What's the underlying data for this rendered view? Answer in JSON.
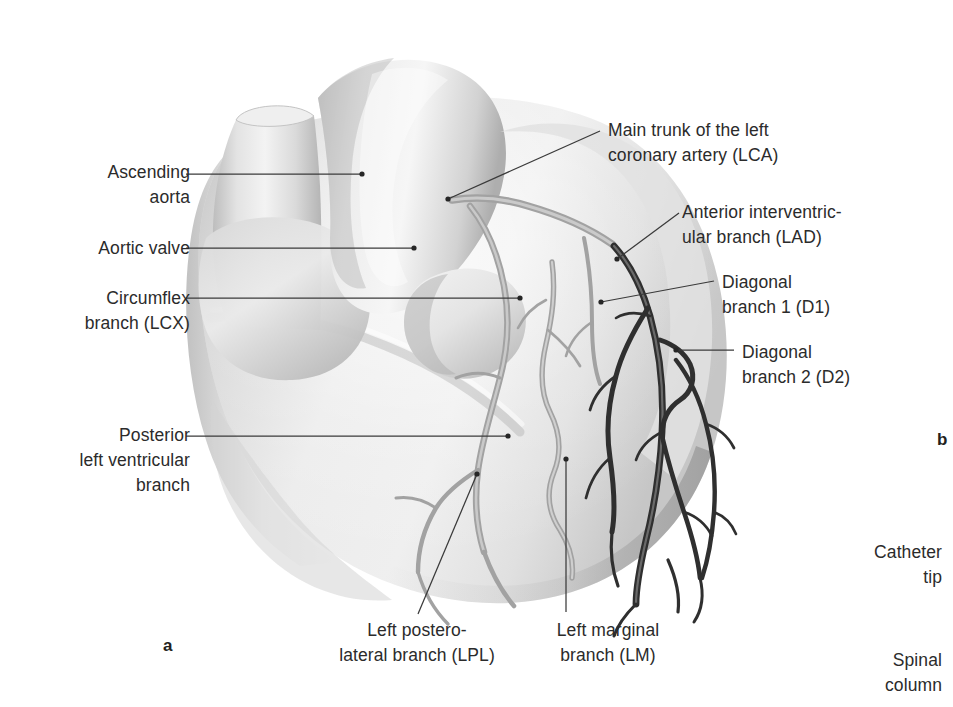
{
  "figure": {
    "domain_kind": "anatomical-illustration",
    "panels": [
      {
        "id": "a",
        "letter": "a"
      },
      {
        "id": "b",
        "letter": "b"
      }
    ],
    "palette": {
      "background": "#ffffff",
      "text": "#2b2b2b",
      "leader_line": "#3a3a3a",
      "myocardium_light": "#f2f2f2",
      "myocardium_mid": "#d9d9d9",
      "myocardium_shadow": "#9a9a9a",
      "vessel_light": "#a8a8a8",
      "vessel_dark": "#2e2e2e"
    }
  },
  "labels": {
    "left": [
      {
        "name": "ascending-aorta",
        "text": "Ascending\naorta"
      },
      {
        "name": "aortic-valve",
        "text": "Aortic valve"
      },
      {
        "name": "circumflex-branch",
        "text": "Circumflex\nbranch (LCX)"
      },
      {
        "name": "posterior-lv-branch",
        "text": "Posterior\nleft ventricular\nbranch"
      }
    ],
    "right": [
      {
        "name": "main-trunk-lca",
        "text": "Main trunk of the left\ncoronary artery (LCA)"
      },
      {
        "name": "lad-branch",
        "text": "Anterior interventric-\nular branch (LAD)"
      },
      {
        "name": "diagonal-1",
        "text": "Diagonal\nbranch 1 (D1)"
      },
      {
        "name": "diagonal-2",
        "text": "Diagonal\nbranch 2 (D2)"
      }
    ],
    "bottom": [
      {
        "name": "lpl-branch",
        "text": "Left postero-\nlateral branch (LPL)"
      },
      {
        "name": "lm-branch",
        "text": "Left marginal\nbranch (LM)"
      }
    ],
    "panel_b": [
      {
        "name": "catheter-tip",
        "text": "Catheter\ntip"
      },
      {
        "name": "spinal-column",
        "text": "Spinal\ncolumn"
      }
    ]
  }
}
